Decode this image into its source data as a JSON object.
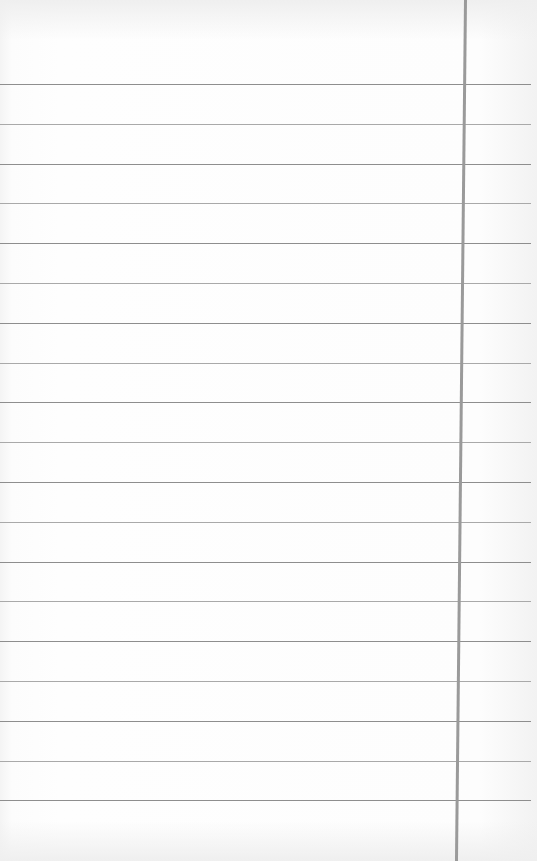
{
  "page": {
    "type": "ruled notebook paper",
    "content_text": ""
  },
  "rules": {
    "count": 19,
    "first_y": 84,
    "spacing": 39.8,
    "color": "#8e8e8e"
  },
  "margin_line": {
    "x_top": 464,
    "x_bottom": 474,
    "color": "#9a9a9a"
  }
}
